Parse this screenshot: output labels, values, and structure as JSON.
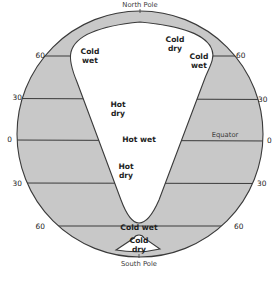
{
  "diagram": {
    "type": "earth-cross-section-climate-zones",
    "colors": {
      "land_shading": "#c8c8c8",
      "outline": "#3a3a3a",
      "background": "#ffffff",
      "text": "#1e1e1e"
    },
    "poles": {
      "north": "North Pole",
      "south": "South Pole"
    },
    "equator_label": "Equator",
    "latitude_ticks": {
      "left": [
        "60",
        "30",
        "0",
        "30",
        "60"
      ],
      "right": [
        "60",
        "30",
        "0",
        "30",
        "60"
      ]
    },
    "zones": {
      "north_cold_wet_left": {
        "line1": "Cold",
        "line2": "wet"
      },
      "north_cold_dry": {
        "line1": "Cold",
        "line2": "dry"
      },
      "north_cold_wet_right": {
        "line1": "Cold",
        "line2": "wet"
      },
      "hot_dry_upper": {
        "line1": "Hot",
        "line2": "dry"
      },
      "hot_wet": "Hot wet",
      "hot_dry_lower": {
        "line1": "Hot",
        "line2": "dry"
      },
      "south_cold_wet": "Cold wet",
      "south_cold_dry": {
        "line1": "Cold",
        "line2": "dry"
      }
    }
  }
}
